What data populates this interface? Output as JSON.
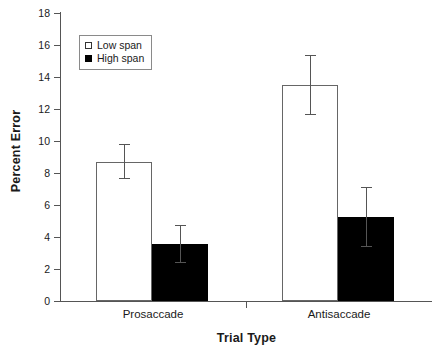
{
  "chart_data": {
    "type": "bar",
    "title": "",
    "xlabel": "Trial Type",
    "ylabel": "Percent Error",
    "categories": [
      "Prosaccade",
      "Antisaccade"
    ],
    "ylim": [
      0,
      18
    ],
    "yticks": [
      0,
      2,
      4,
      6,
      8,
      10,
      12,
      14,
      16,
      18
    ],
    "ytick_labels": [
      "0",
      "2",
      "4",
      "6",
      "8",
      "10",
      "12",
      "14",
      "16",
      "18"
    ],
    "grid": false,
    "legend_position": "upper left inside",
    "error_bar_type": "standard error",
    "series": [
      {
        "name": "Low span",
        "color": "#ffffff",
        "edge_color": "#666666",
        "values": [
          8.7,
          13.5
        ],
        "errors": [
          1.1,
          1.9
        ]
      },
      {
        "name": "High span",
        "color": "#000000",
        "edge_color": "#000000",
        "values": [
          3.55,
          5.25
        ],
        "errors": [
          1.2,
          1.9
        ]
      }
    ]
  },
  "legend": {
    "items": [
      {
        "label": "Low span",
        "swatch": "open-square"
      },
      {
        "label": "High span",
        "swatch": "filled-square"
      }
    ]
  }
}
